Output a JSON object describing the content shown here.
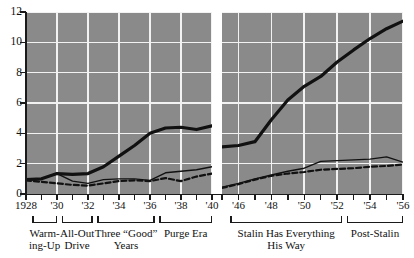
{
  "chart_data": {
    "type": "line",
    "title": "",
    "xlabel": "",
    "ylabel": "",
    "ylim": [
      0,
      12
    ],
    "yticks": [
      0,
      2,
      4,
      6,
      8,
      10,
      12
    ],
    "grid": true,
    "legend": "none",
    "axis_break": true,
    "panels": [
      {
        "name": "prewar",
        "xlim": [
          1928,
          1940
        ],
        "xticks": [
          1928,
          1929,
          1930,
          1931,
          1932,
          1933,
          1934,
          1935,
          1936,
          1937,
          1938,
          1939,
          1940
        ],
        "xticklabels": [
          "1928",
          "",
          "'30",
          "",
          "'32",
          "",
          "'34",
          "",
          "'36",
          "",
          "'38",
          "",
          "'40"
        ]
      },
      {
        "name": "postwar",
        "xlim": [
          1945,
          1956
        ],
        "xticks": [
          1945,
          1946,
          1947,
          1948,
          1949,
          1950,
          1951,
          1952,
          1953,
          1954,
          1955,
          1956
        ],
        "xticklabels": [
          "",
          "'46",
          "",
          "'48",
          "",
          "'50",
          "",
          "'52",
          "",
          "'54",
          "",
          "'56"
        ]
      }
    ],
    "series": [
      {
        "name": "heavy-industry",
        "style": "thick-solid",
        "color": "#111111",
        "panel_values": [
          {
            "panel": "prewar",
            "x": [
              1928,
              1929,
              1930,
              1931,
              1932,
              1933,
              1934,
              1935,
              1936,
              1937,
              1938,
              1939,
              1940
            ],
            "y": [
              0.95,
              1.0,
              1.35,
              1.3,
              1.35,
              1.8,
              2.5,
              3.2,
              4.0,
              4.35,
              4.4,
              4.25,
              4.5
            ]
          },
          {
            "panel": "postwar",
            "x": [
              1945,
              1946,
              1947,
              1948,
              1949,
              1950,
              1951,
              1952,
              1953,
              1954,
              1955,
              1956
            ],
            "y": [
              3.1,
              3.2,
              3.45,
              4.9,
              6.2,
              7.1,
              7.75,
              8.7,
              9.5,
              10.25,
              10.9,
              11.4
            ]
          }
        ]
      },
      {
        "name": "light-industry",
        "style": "thin-solid",
        "color": "#111111",
        "panel_values": [
          {
            "panel": "prewar",
            "x": [
              1928,
              1929,
              1930,
              1931,
              1932,
              1933,
              1934,
              1935,
              1936,
              1937,
              1938,
              1939,
              1940
            ],
            "y": [
              0.95,
              1.0,
              1.35,
              0.85,
              0.7,
              0.95,
              1.0,
              1.0,
              0.9,
              1.4,
              1.5,
              1.6,
              1.8
            ]
          },
          {
            "panel": "postwar",
            "x": [
              1945,
              1946,
              1947,
              1948,
              1949,
              1950,
              1951,
              1952,
              1953,
              1954,
              1955,
              1956
            ],
            "y": [
              0.45,
              0.7,
              1.0,
              1.25,
              1.5,
              1.7,
              2.15,
              2.2,
              2.25,
              2.3,
              2.45,
              2.1
            ]
          }
        ]
      },
      {
        "name": "consumer-goods",
        "style": "dashed",
        "color": "#111111",
        "panel_values": [
          {
            "panel": "prewar",
            "x": [
              1928,
              1929,
              1930,
              1931,
              1932,
              1933,
              1934,
              1935,
              1936,
              1937,
              1938,
              1939,
              1940
            ],
            "y": [
              0.9,
              0.8,
              0.7,
              0.6,
              0.55,
              0.7,
              0.85,
              0.9,
              0.85,
              1.05,
              0.85,
              1.15,
              1.35
            ]
          },
          {
            "panel": "postwar",
            "x": [
              1945,
              1946,
              1947,
              1948,
              1949,
              1950,
              1951,
              1952,
              1953,
              1954,
              1955,
              1956
            ],
            "y": [
              0.4,
              0.65,
              0.95,
              1.2,
              1.35,
              1.45,
              1.6,
              1.65,
              1.7,
              1.8,
              1.85,
              1.95
            ]
          }
        ]
      }
    ],
    "eras": [
      {
        "id": "warming-up",
        "label": "Warming-Up",
        "label_lines": "Warm-\ning-Up",
        "panel": "prewar",
        "from": 1928.4,
        "to": 1930.0
      },
      {
        "id": "all-out-drive",
        "label": "All-Out Drive",
        "label_lines": "All-Out\nDrive",
        "panel": "prewar",
        "from": 1930.3,
        "to": 1932.3
      },
      {
        "id": "three-good-years",
        "label": "Three “Good” Years",
        "label_lines": "Three “Good”\nYears",
        "panel": "prewar",
        "from": 1932.6,
        "to": 1936.3
      },
      {
        "id": "purge-era",
        "label": "Purge Era",
        "label_lines": "Purge Era",
        "panel": "prewar",
        "from": 1936.6,
        "to": 1940.0
      },
      {
        "id": "stalin-has-everything-his-way",
        "label": "Stalin Has Everything His Way",
        "label_lines": "Stalin Has Everything\nHis Way",
        "panel": "postwar",
        "from": 1945.5,
        "to": 1952.3
      },
      {
        "id": "post-stalin",
        "label": "Post-Stalin",
        "label_lines": "Post-Stalin",
        "panel": "postwar",
        "from": 1952.6,
        "to": 1956.0
      }
    ]
  }
}
